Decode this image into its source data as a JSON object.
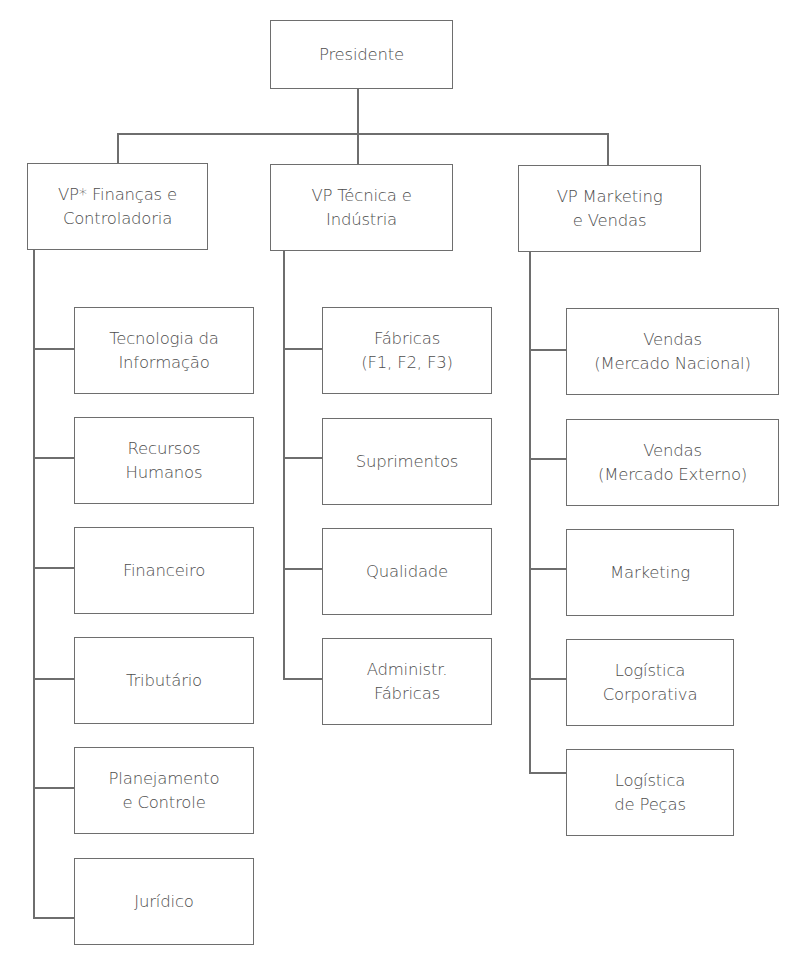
{
  "diagram": {
    "type": "org-chart",
    "root": {
      "label": "Presidente"
    },
    "divisions": [
      {
        "label": "VP* Finanças e\nControladoria",
        "children": [
          {
            "label": "Tecnologia da\nInformação"
          },
          {
            "label": "Recursos\nHumanos"
          },
          {
            "label": "Financeiro"
          },
          {
            "label": "Tributário"
          },
          {
            "label": "Planejamento\ne Controle"
          },
          {
            "label": "Jurídico"
          }
        ]
      },
      {
        "label": "VP Técnica e\nIndústria",
        "children": [
          {
            "label": "Fábricas\n(F1, F2, F3)"
          },
          {
            "label": "Suprimentos"
          },
          {
            "label": "Qualidade"
          },
          {
            "label": "Administr.\nFábricas"
          }
        ]
      },
      {
        "label": "VP Marketing\ne Vendas",
        "children": [
          {
            "label": "Vendas\n(Mercado Nacional)"
          },
          {
            "label": "Vendas\n(Mercado Externo)"
          },
          {
            "label": "Marketing"
          },
          {
            "label": "Logística\nCorporativa"
          },
          {
            "label": "Logística\nde Peças"
          }
        ]
      }
    ]
  },
  "colors": {
    "line": "#6e6e6e",
    "text": "#4d4d4d",
    "background": "#ffffff"
  }
}
